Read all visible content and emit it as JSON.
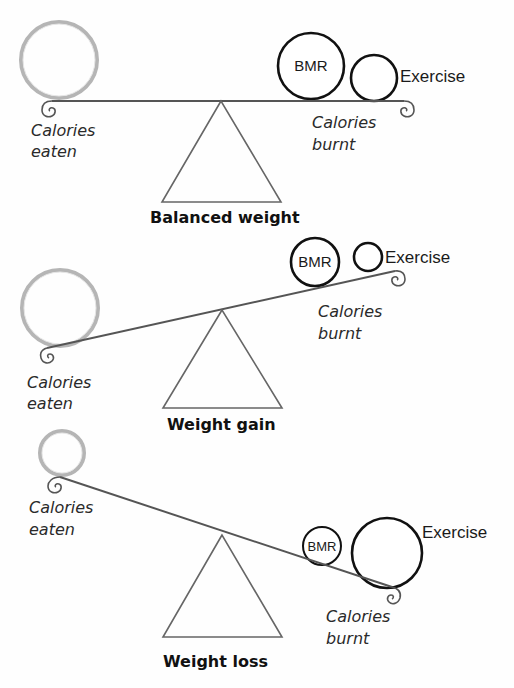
{
  "colors": {
    "beam": "#555555",
    "calories_eaten_circle": "#b5b5b5",
    "calories_burnt_circle": "#111111",
    "text": "#1a1a1a"
  },
  "scales": [
    {
      "title": "Balanced weight",
      "state": "level",
      "left_label_line1": "Calories",
      "left_label_line2": "eaten",
      "right_label_line1": "Calories",
      "right_label_line2": "burnt",
      "bmr_label": "BMR",
      "exercise_label": "Exercise"
    },
    {
      "title": "Weight gain",
      "state": "tilted-left-down",
      "left_label_line1": "Calories",
      "left_label_line2": "eaten",
      "right_label_line1": "Calories",
      "right_label_line2": "burnt",
      "bmr_label": "BMR",
      "exercise_label": "Exercise"
    },
    {
      "title": "Weight loss",
      "state": "tilted-right-down",
      "left_label_line1": "Calories",
      "left_label_line2": "eaten",
      "right_label_line1": "Calories",
      "right_label_line2": "burnt",
      "bmr_label": "BMR",
      "exercise_label": "Exercise"
    }
  ]
}
